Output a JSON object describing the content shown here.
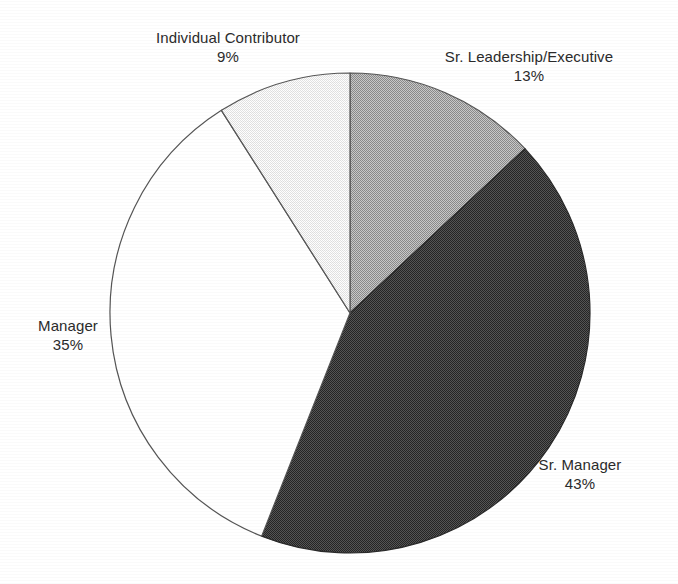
{
  "chart_data": {
    "type": "pie",
    "title": "",
    "subtitle": "",
    "xlabel": "",
    "ylabel": "",
    "legend_position": "none",
    "grid": false,
    "label_format": "name + percent",
    "start_angle_deg": 0,
    "direction": "clockwise",
    "categories": [
      "Sr. Leadership/Executive",
      "Sr. Manager",
      "Manager",
      "Individual Contributor"
    ],
    "values": [
      13,
      35,
      43,
      9
    ],
    "slices": [
      {
        "label": "Sr. Leadership/Executive",
        "value": 13,
        "value_text": "13%",
        "fill": "#a6a6a6",
        "fill_style": "dither-medium",
        "stroke": "#555555",
        "start_deg": 0,
        "end_deg": 46.8
      },
      {
        "label": "Sr. Manager",
        "value": 43,
        "value_text": "43%",
        "fill": "#3d3d3d",
        "fill_style": "dither-dark",
        "stroke": "#2a2a2a",
        "start_deg": 46.8,
        "end_deg": 201.6
      },
      {
        "label": "Manager",
        "value": 35,
        "value_text": "35%",
        "fill": "#ffffff",
        "fill_style": "solid-white",
        "stroke": "#555555",
        "start_deg": 201.6,
        "end_deg": 327.6
      },
      {
        "label": "Individual Contributor",
        "value": 9,
        "value_text": "9%",
        "fill": "#ededed",
        "fill_style": "solid-light",
        "stroke": "#555555",
        "start_deg": 327.6,
        "end_deg": 360
      }
    ],
    "geometry": {
      "center_x": 350,
      "center_y": 313,
      "radius": 240
    },
    "colors": {
      "background": "#ffffff",
      "text": "#2b2b2b",
      "outline": "#555555"
    }
  },
  "labels": {
    "individual_contributor": {
      "name": "Individual Contributor",
      "value": "9%"
    },
    "sr_leadership": {
      "name": "Sr. Leadership/Executive",
      "value": "13%"
    },
    "sr_manager": {
      "name": "Sr. Manager",
      "value": "43%"
    },
    "manager": {
      "name": "Manager",
      "value": "35%"
    }
  }
}
